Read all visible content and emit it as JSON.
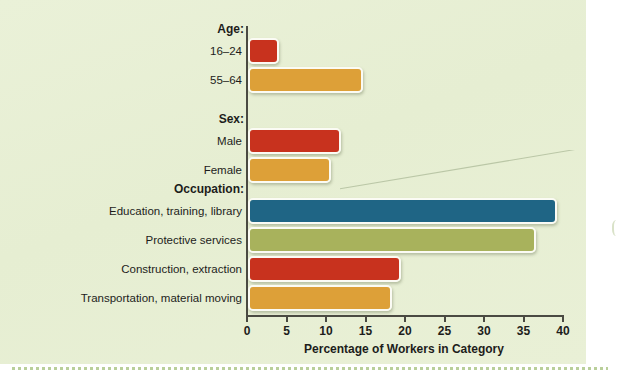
{
  "chart_data": {
    "type": "bar",
    "orientation": "horizontal",
    "title": "",
    "xlabel": "Percentage of Workers in Category",
    "ylabel": "",
    "xlim": [
      0,
      40
    ],
    "xticks": [
      0,
      5,
      10,
      15,
      20,
      25,
      30,
      35,
      40
    ],
    "grid": false,
    "legend": "none",
    "groups": [
      {
        "header": "Age:",
        "categories": [
          "16–24",
          "55–64"
        ],
        "values": [
          3.7,
          14.3
        ],
        "colors": [
          "#c8321e",
          "#dda038"
        ]
      },
      {
        "header": "Sex:",
        "categories": [
          "Male",
          "Female"
        ],
        "values": [
          11.5,
          10.2
        ],
        "colors": [
          "#c8321e",
          "#dda038"
        ]
      },
      {
        "header": "Occupation:",
        "categories": [
          "Education, training, library",
          "Protective services",
          "Construction, extraction",
          "Transportation, material moving"
        ],
        "values": [
          38.9,
          36.2,
          19.1,
          18.0
        ],
        "colors": [
          "#1f6585",
          "#a8b25c",
          "#c8321e",
          "#dda038"
        ]
      }
    ],
    "categories": [
      "16–24",
      "55–64",
      "Male",
      "Female",
      "Education, training, library",
      "Protective services",
      "Construction, extraction",
      "Transportation, material moving"
    ],
    "values": [
      3.7,
      14.3,
      11.5,
      10.2,
      38.9,
      36.2,
      19.1,
      18.0
    ]
  },
  "colors": {
    "background": "#e7efd4",
    "axis": "#4a4a42",
    "text": "#1d1d1b",
    "bar_red": "#c8321e",
    "bar_orange": "#dda038",
    "bar_blue": "#1f6585",
    "bar_olive": "#a8b25c",
    "bar_outline": "#fbfbf4",
    "rule_dotted": "#b9cf9a"
  },
  "axis": {
    "ticks": [
      "0",
      "5",
      "10",
      "15",
      "20",
      "25",
      "30",
      "35",
      "40"
    ],
    "title": "Percentage of Workers in Category"
  },
  "groups": {
    "age": {
      "header": "Age:",
      "rows": [
        {
          "label": "16–24",
          "value": 3.7,
          "color": "#c8321e"
        },
        {
          "label": "55–64",
          "value": 14.3,
          "color": "#dda038"
        }
      ]
    },
    "sex": {
      "header": "Sex:",
      "rows": [
        {
          "label": "Male",
          "value": 11.5,
          "color": "#c8321e"
        },
        {
          "label": "Female",
          "value": 10.2,
          "color": "#dda038"
        }
      ]
    },
    "occupation": {
      "header": "Occupation:",
      "rows": [
        {
          "label": "Education, training, library",
          "value": 38.9,
          "color": "#1f6585"
        },
        {
          "label": "Protective services",
          "value": 36.2,
          "color": "#a8b25c"
        },
        {
          "label": "Construction, extraction",
          "value": 19.1,
          "color": "#c8321e"
        },
        {
          "label": "Transportation, material moving",
          "value": 18.0,
          "color": "#dda038"
        }
      ]
    }
  }
}
